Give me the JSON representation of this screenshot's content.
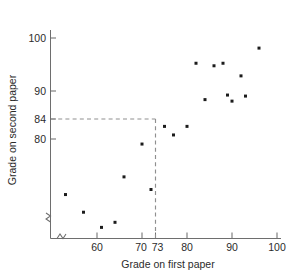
{
  "chart_data": {
    "type": "scatter",
    "title": "",
    "xlabel": "Grade on first paper",
    "ylabel": "Grade on second paper",
    "xlim": [
      50,
      101
    ],
    "ylim": [
      60,
      102
    ],
    "grid": false,
    "legend": null,
    "x_ticks": [
      60,
      70,
      73,
      80,
      90,
      100
    ],
    "x_tick_labels": [
      "60",
      "70",
      "73",
      "80",
      "90",
      "100"
    ],
    "y_ticks": [
      80,
      84,
      90,
      100
    ],
    "y_tick_labels": [
      "80",
      "84",
      "90",
      "100"
    ],
    "axis_break_x": true,
    "axis_break_y": true,
    "annotations": [
      {
        "name": "reference-lines",
        "type": "dashed-crosshair",
        "x": 73,
        "y": 84,
        "description": "Dashed horizontal line at y=84 meeting dashed vertical line at x=73"
      }
    ],
    "points": [
      {
        "x": 53,
        "y": 69
      },
      {
        "x": 57,
        "y": 65.5
      },
      {
        "x": 61,
        "y": 62.5
      },
      {
        "x": 64,
        "y": 63.5
      },
      {
        "x": 66,
        "y": 72.5
      },
      {
        "x": 70,
        "y": 79
      },
      {
        "x": 72,
        "y": 70
      },
      {
        "x": 75,
        "y": 82.5
      },
      {
        "x": 77,
        "y": 80.8
      },
      {
        "x": 80,
        "y": 82.5
      },
      {
        "x": 82,
        "y": 95
      },
      {
        "x": 84,
        "y": 87.8
      },
      {
        "x": 86,
        "y": 94.5
      },
      {
        "x": 88,
        "y": 95
      },
      {
        "x": 89,
        "y": 88.7
      },
      {
        "x": 90,
        "y": 87.5
      },
      {
        "x": 92,
        "y": 92.5
      },
      {
        "x": 93,
        "y": 88.5
      },
      {
        "x": 96,
        "y": 98
      }
    ]
  },
  "colors": {
    "point": "#1c1c1c",
    "axis": "#6e6e6e",
    "guide": "#8f8f8f",
    "text": "#2b2b2b",
    "background": "#ffffff"
  }
}
